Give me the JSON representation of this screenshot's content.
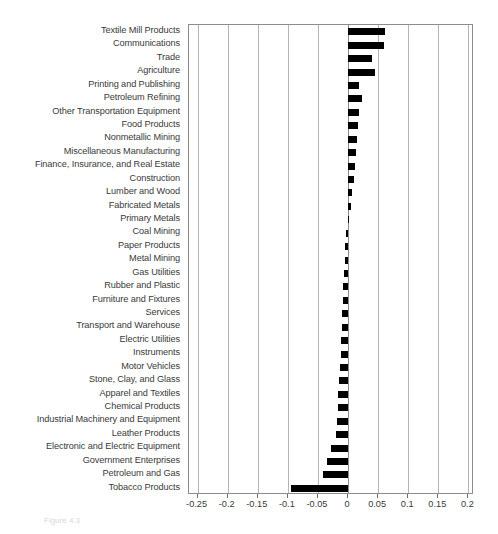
{
  "figure": {
    "caption": "Figure 4.3"
  },
  "chart_data": {
    "type": "bar",
    "orientation": "horizontal",
    "title": "",
    "xlabel": "",
    "ylabel": "",
    "xlim": [
      -0.2643,
      0.2093
    ],
    "ylim": [
      0,
      35
    ],
    "grid": true,
    "legend": "none",
    "bar_color": "#000000",
    "xticks": [
      -0.25,
      -0.2,
      -0.15,
      -0.1,
      -0.05,
      0,
      0.05,
      0.1,
      0.15,
      0.2
    ],
    "xticklabels": [
      "-0.25",
      "-0.2",
      "-0.15",
      "-0.1",
      "-0.05",
      "0",
      "0.05",
      "0.1",
      "0.15",
      "0.2"
    ],
    "categories": [
      "Textile Mill Products",
      "Communications",
      "Trade",
      "Agriculture",
      "Printing and Publishing",
      "Petroleum Refining",
      "Other Transportation Equipment",
      "Food Products",
      "Nonmetallic Mining",
      "Miscellaneous Manufacturing",
      "Finance, Insurance, and Real Estate",
      "Construction",
      "Lumber and Wood",
      "Fabricated Metals",
      "Primary Metals",
      "Coal Mining",
      "Paper Products",
      "Metal Mining",
      "Gas Utilities",
      "Rubber and Plastic",
      "Furniture and Fixtures",
      "Services",
      "Transport and Warehouse",
      "Electric Utilities",
      "Instruments",
      "Motor Vehicles",
      "Stone, Clay, and Glass",
      "Apparel and Textiles",
      "Chemical Products",
      "Industrial Machinery and Equipment",
      "Leather Products",
      "Electronic and Electric Equipment",
      "Government Enterprises",
      "Petroleum and Gas",
      "Tobacco Products"
    ],
    "values": [
      0.0615,
      0.06,
      0.0395,
      0.0455,
      0.0185,
      0.023,
      0.018,
      0.0165,
      0.015,
      0.013,
      0.0115,
      0.0105,
      0.006,
      0.0055,
      0.001,
      -0.0035,
      -0.0045,
      -0.0055,
      -0.007,
      -0.008,
      -0.0085,
      -0.0095,
      -0.0105,
      -0.0115,
      -0.0125,
      -0.014,
      -0.015,
      -0.016,
      -0.017,
      -0.019,
      -0.0205,
      -0.0285,
      -0.0345,
      -0.042,
      -0.0955
    ]
  }
}
